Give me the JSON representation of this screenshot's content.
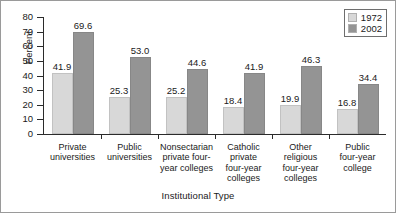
{
  "chart_data": {
    "type": "bar",
    "title": "",
    "xlabel": "Institutional Type",
    "ylabel": "Percent",
    "ylim": [
      0,
      80
    ],
    "yticks": [
      0,
      10,
      20,
      30,
      40,
      50,
      60,
      70,
      80
    ],
    "grid": false,
    "legend_position": "top-right",
    "categories": [
      "Private universities",
      "Public universities",
      "Nonsectarian private four-year colleges",
      "Catholic private four-year colleges",
      "Other religious four-year colleges",
      "Public four-year college"
    ],
    "category_lines": [
      [
        "Private",
        "universities"
      ],
      [
        "Public",
        "universities"
      ],
      [
        "Nonsectarian",
        "private four-",
        "year colleges"
      ],
      [
        "Catholic",
        "private",
        "four-year",
        "colleges"
      ],
      [
        "Other",
        "religious",
        "four-year",
        "colleges"
      ],
      [
        "Public",
        "four-year",
        "college"
      ]
    ],
    "series": [
      {
        "name": "1972",
        "color": "#d8d8d8",
        "values": [
          41.9,
          25.3,
          25.2,
          18.4,
          19.9,
          16.8
        ],
        "labels": [
          "41.9",
          "25.3",
          "25.2",
          "18.4",
          "19.9",
          "16.8"
        ]
      },
      {
        "name": "2002",
        "color": "#949494",
        "values": [
          69.6,
          53.0,
          44.6,
          41.9,
          46.3,
          34.4
        ],
        "labels": [
          "69.6",
          "53.0",
          "44.6",
          "41.9",
          "46.3",
          "34.4"
        ]
      }
    ]
  },
  "legend": {
    "entries": [
      {
        "label": "1972"
      },
      {
        "label": "2002"
      }
    ]
  },
  "axes": {
    "y_tick_labels": [
      "80",
      "70",
      "60",
      "50",
      "40",
      "30",
      "20",
      "10",
      "0"
    ],
    "y_title": "Percent",
    "x_title": "Institutional Type"
  }
}
